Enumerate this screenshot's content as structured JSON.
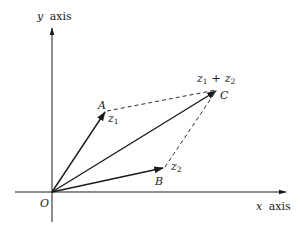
{
  "diagram": {
    "title": "",
    "axes": {
      "x_label": "x axis",
      "x_var": "x",
      "x_word": "axis",
      "y_label": "y axis",
      "y_var": "y",
      "y_word": "axis"
    },
    "points": {
      "origin": {
        "label": "O",
        "pos": [
          52,
          192
        ]
      },
      "A": {
        "label": "A",
        "pos": [
          105,
          112
        ]
      },
      "B": {
        "label": "B",
        "pos": [
          163,
          168
        ]
      },
      "C": {
        "label": "C",
        "pos": [
          218,
          90
        ]
      }
    },
    "vectors": [
      {
        "from": "O",
        "to": "A",
        "label": "z1",
        "base": "z",
        "sub": "1",
        "style": "solid-arrow"
      },
      {
        "from": "O",
        "to": "B",
        "label": "z2",
        "base": "z",
        "sub": "2",
        "style": "solid-arrow"
      },
      {
        "from": "O",
        "to": "C",
        "label": "z1 + z2",
        "style": "solid-arrow"
      }
    ],
    "dashed_lines": [
      {
        "from": "A",
        "to": "C"
      },
      {
        "from": "B",
        "to": "C"
      }
    ],
    "labels": {
      "z1_base": "z",
      "z1_sub": "1",
      "z2_base": "z",
      "z2_sub": "2",
      "sum_a_base": "z",
      "sum_a_sub": "1",
      "sum_plus": "+",
      "sum_b_base": "z",
      "sum_b_sub": "2"
    },
    "colors": {
      "ink": "#1a1a1a",
      "background": "#ffffff"
    }
  }
}
